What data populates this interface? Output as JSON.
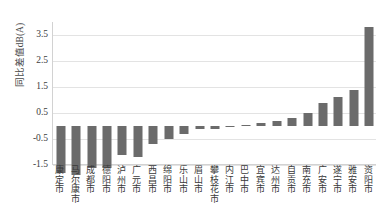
{
  "chart_data": {
    "type": "bar",
    "title": "",
    "subtitle": "",
    "xlabel": "",
    "ylabel": "同比差值dB(A)",
    "ylim": [
      -1.5,
      4.0
    ],
    "yticks": [
      3.5,
      2.5,
      1.5,
      0.5,
      -0.5,
      -1.5
    ],
    "ytick_labels": [
      "3.5",
      "2.5",
      "1.5",
      "0.5",
      "-0.5",
      "-1.5"
    ],
    "grid": true,
    "legend": "none",
    "bar_color": "#6b6b6b",
    "categories": [
      "康定市",
      "马尔康市",
      "成都市",
      "德阳市",
      "泸州市",
      "广元市",
      "西昌市",
      "绵阳市",
      "乐山市",
      "眉山市",
      "攀枝花市",
      "内江市",
      "巴中市",
      "宜宾市",
      "达州市",
      "自贡市",
      "南充市",
      "广安市",
      "遂宁市",
      "雅安市",
      "资阳市"
    ],
    "values": [
      -1.8,
      -1.9,
      -1.6,
      -1.6,
      -1.1,
      -1.2,
      -0.7,
      -0.5,
      -0.3,
      -0.1,
      -0.1,
      -0.05,
      0.05,
      0.1,
      0.2,
      0.3,
      0.5,
      0.9,
      1.1,
      1.4,
      3.8
    ]
  }
}
